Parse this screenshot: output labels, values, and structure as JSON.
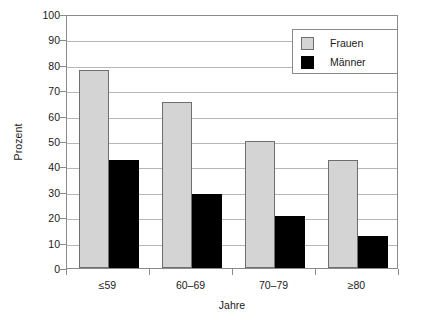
{
  "chart_data": {
    "type": "bar",
    "title": "",
    "subtitle": "",
    "xlabel": "Jahre",
    "ylabel": "Prozent",
    "categories": [
      "≤59",
      "60–69",
      "70–79",
      "≥80"
    ],
    "series": [
      {
        "name": "Frauen",
        "color": "#d4d4d4",
        "values": [
          78,
          65.5,
          50,
          42.5
        ]
      },
      {
        "name": "Männer",
        "color": "#000000",
        "values": [
          42.5,
          29,
          20.3,
          12.5
        ]
      }
    ],
    "ylim": [
      0,
      100
    ],
    "ytick_values": [
      0,
      10,
      20,
      30,
      40,
      50,
      60,
      70,
      80,
      90,
      100
    ],
    "ytick_labels": [
      "0",
      "10",
      "20",
      "30",
      "40",
      "50",
      "60",
      "70",
      "80",
      "90",
      "100"
    ],
    "grid": "horizontal",
    "legend_position": "top-right",
    "legend_entries": [
      "Frauen",
      "Männer"
    ]
  },
  "axes": {
    "y_title": "Prozent",
    "x_title": "Jahre"
  },
  "legend": {
    "items": [
      {
        "label": "Frauen"
      },
      {
        "label": "Männer"
      }
    ]
  }
}
